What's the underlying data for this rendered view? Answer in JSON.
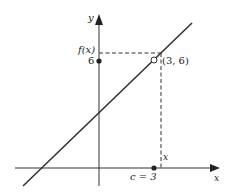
{
  "figure": {
    "axes": {
      "x_label": "x",
      "y_label": "y"
    },
    "labels": {
      "fx": "f(x)",
      "six": "6",
      "point": "(3, 6)",
      "x_near": "x",
      "c_eq": "c = 3"
    },
    "line": {
      "description": "straight line through open circle at (3, 6)"
    },
    "points": [
      {
        "name": "open-circle",
        "coords": "(3, 6)",
        "filled": false
      },
      {
        "name": "y-axis-dot",
        "coords": "(0, 6)",
        "filled": true
      },
      {
        "name": "x-axis-dot",
        "coords": "(3, 0)",
        "filled": true
      }
    ],
    "colors": {
      "ink": "#333333",
      "background": "#ffffff"
    }
  }
}
